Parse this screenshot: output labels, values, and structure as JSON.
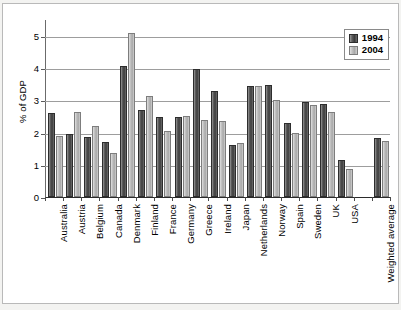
{
  "chart_data": {
    "type": "bar",
    "title": "",
    "xlabel": "",
    "ylabel": "% of GDP",
    "ylim": [
      0,
      5.4
    ],
    "yticks": [
      0,
      1,
      2,
      3,
      4,
      5
    ],
    "grid": true,
    "legend_position": "top-right",
    "categories": [
      "Australia",
      "Austria",
      "Belgium",
      "Canada",
      "Denmark",
      "Finland",
      "France",
      "Germany",
      "Greece",
      "Ireland",
      "Japan",
      "Netherlands",
      "Norway",
      "Spain",
      "Sweden",
      "UK",
      "USA",
      "",
      "Weighted average"
    ],
    "series": [
      {
        "name": "1994",
        "color": "#4a4a4a",
        "values": [
          2.6,
          1.95,
          1.85,
          1.72,
          4.08,
          2.7,
          2.48,
          2.48,
          3.97,
          3.28,
          1.62,
          3.43,
          3.47,
          2.31,
          2.94,
          2.88,
          1.15,
          null,
          1.84
        ]
      },
      {
        "name": "2004",
        "color": "#bdbdbd",
        "values": [
          1.9,
          2.65,
          2.2,
          1.37,
          5.08,
          3.12,
          2.06,
          2.52,
          2.38,
          2.36,
          1.67,
          3.44,
          3.02,
          1.99,
          2.87,
          2.63,
          0.86,
          null,
          1.73
        ]
      }
    ]
  },
  "legend": {
    "items": [
      {
        "label": "1994"
      },
      {
        "label": "2004"
      }
    ]
  },
  "axis": {
    "y_title": "% of GDP",
    "y_tick_labels": [
      "5",
      "4",
      "3",
      "2",
      "1",
      "0"
    ]
  }
}
